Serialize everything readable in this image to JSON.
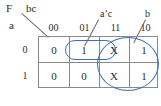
{
  "figure": {
    "function_label": "F",
    "col_var_label": "bc",
    "row_var_label": "a"
  },
  "kmap": {
    "col_headers": [
      "00",
      "01",
      "11",
      "10"
    ],
    "row_headers": [
      "0",
      "1"
    ],
    "rows": [
      [
        "0",
        "1",
        "X",
        "1"
      ],
      [
        "0",
        "0",
        "X",
        "1"
      ]
    ]
  },
  "groups": [
    {
      "name": "a-prime-c",
      "label": "a’c"
    },
    {
      "name": "b",
      "label": "b"
    }
  ],
  "colors": {
    "loop": "#3a6fb5",
    "grid": "#8a8a8a",
    "text": "#2b2b2b"
  }
}
